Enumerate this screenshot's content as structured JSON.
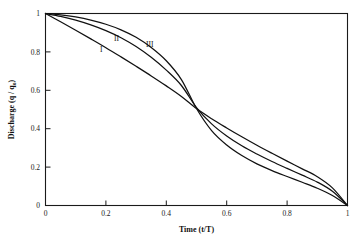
{
  "chart_data": {
    "type": "line",
    "title": "",
    "xlabel": "Time (t/T)",
    "ylabel_main": "Discharge (q / q",
    "ylabel_sub": "o",
    "ylabel_close": ")",
    "ylabel_full": "Discharge (q / qo)",
    "xlim": [
      0,
      1
    ],
    "ylim": [
      0,
      1
    ],
    "grid": false,
    "legend_position": "inline-curve-labels",
    "xticks": [
      0,
      0.2,
      0.4,
      0.6,
      0.8,
      1
    ],
    "xticklabels": [
      "0",
      "0.2",
      "0.4",
      "0.6",
      "0.8",
      "1"
    ],
    "yticks": [
      0,
      0.2,
      0.4,
      0.6,
      0.8,
      1
    ],
    "yticklabels": [
      "0",
      "0.2",
      "0.4",
      "0.6",
      "0.8",
      "1"
    ],
    "x": [
      0,
      0.05,
      0.1,
      0.15,
      0.2,
      0.25,
      0.3,
      0.35,
      0.4,
      0.45,
      0.5,
      0.55,
      0.6,
      0.65,
      0.7,
      0.75,
      0.8,
      0.85,
      0.9,
      0.95,
      1
    ],
    "series": [
      {
        "name": "I",
        "label": "I",
        "label_x": 0.185,
        "label_y": 0.8,
        "values": [
          1.0,
          0.957,
          0.913,
          0.868,
          0.822,
          0.774,
          0.725,
          0.675,
          0.623,
          0.568,
          0.505,
          0.452,
          0.404,
          0.358,
          0.314,
          0.272,
          0.231,
          0.191,
          0.15,
          0.092,
          0.0
        ]
      },
      {
        "name": "II",
        "label": "II",
        "label_x": 0.235,
        "label_y": 0.855,
        "values": [
          1.0,
          0.985,
          0.966,
          0.941,
          0.911,
          0.874,
          0.828,
          0.772,
          0.705,
          0.625,
          0.51,
          0.425,
          0.362,
          0.311,
          0.268,
          0.229,
          0.193,
          0.158,
          0.122,
          0.074,
          0.0
        ]
      },
      {
        "name": "III",
        "label": "III",
        "label_x": 0.345,
        "label_y": 0.825,
        "values": [
          1.0,
          0.993,
          0.982,
          0.966,
          0.944,
          0.915,
          0.876,
          0.823,
          0.754,
          0.656,
          0.505,
          0.39,
          0.315,
          0.26,
          0.217,
          0.182,
          0.151,
          0.121,
          0.09,
          0.052,
          0.0
        ]
      }
    ]
  },
  "figure": {
    "background": "#ffffff",
    "axis_color": "#1a1a1a",
    "curve_color": "#111111"
  }
}
